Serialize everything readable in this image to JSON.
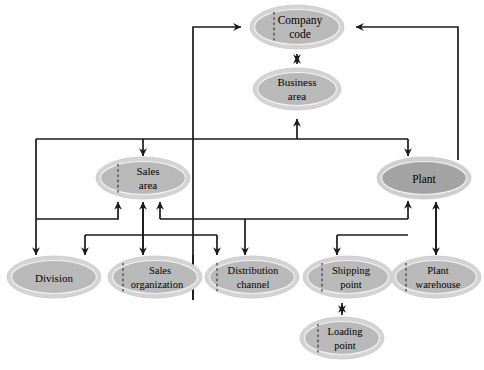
{
  "diagram": {
    "canvas": {
      "width": 484,
      "height": 370,
      "background": "#ffffff"
    },
    "style": {
      "node_fill_light": "#b9b9b9",
      "node_fill_dark": "#a3a3a3",
      "node_ring_fill": "#d4d4d4",
      "node_ring_stroke": "#c9c9c9",
      "edge_color": "#1a1a1a",
      "label_color": "#000000",
      "seam_color": "#2b2b2b"
    },
    "nodes": [
      {
        "id": "company-code",
        "label_line1": "Company",
        "label_line2": "code",
        "cx": 297,
        "cy": 27,
        "rx": 47,
        "ry": 22,
        "fill": "#b9b9b9",
        "seam": true
      },
      {
        "id": "business-area",
        "label_line1": "Business",
        "label_line2": "area",
        "cx": 297,
        "cy": 89,
        "rx": 44,
        "ry": 21,
        "fill": "#b9b9b9",
        "seam": false
      },
      {
        "id": "sales-area",
        "label_line1": "Sales",
        "label_line2": "area",
        "cx": 143,
        "cy": 178,
        "rx": 47,
        "ry": 21,
        "fill": "#b9b9b9",
        "seam": true
      },
      {
        "id": "plant",
        "label_line1": "Plant",
        "label_line2": "",
        "cx": 424,
        "cy": 178,
        "rx": 47,
        "ry": 21,
        "fill": "#a3a3a3",
        "seam": false
      },
      {
        "id": "division",
        "label_line1": "Division",
        "label_line2": "",
        "cx": 54,
        "cy": 277,
        "rx": 47,
        "ry": 21,
        "fill": "#b9b9b9",
        "seam": false
      },
      {
        "id": "sales-organization",
        "label_line1": "Sales",
        "label_line2": "organization",
        "cx": 155,
        "cy": 277,
        "rx": 47,
        "ry": 21,
        "fill": "#b9b9b9",
        "seam": true
      },
      {
        "id": "distribution-channel",
        "label_line1": "Distribution",
        "label_line2": "channel",
        "cx": 252,
        "cy": 277,
        "rx": 47,
        "ry": 21,
        "fill": "#b9b9b9",
        "seam": true
      },
      {
        "id": "shipping-point",
        "label_line1": "Shipping",
        "label_line2": "point",
        "cx": 348,
        "cy": 277,
        "rx": 45,
        "ry": 21,
        "fill": "#b9b9b9",
        "seam": true
      },
      {
        "id": "plant-warehouse",
        "label_line1": "Plant",
        "label_line2": "warehouse",
        "cx": 436,
        "cy": 277,
        "rx": 45,
        "ry": 21,
        "fill": "#b9b9b9",
        "seam": true
      },
      {
        "id": "loading-point",
        "label_line1": "Loading",
        "label_line2": "point",
        "cx": 342,
        "cy": 338,
        "rx": 42,
        "ry": 21,
        "fill": "#b9b9b9",
        "seam": true
      }
    ],
    "edges": [
      {
        "id": "business-area-to-company-code",
        "from": "business-area",
        "to": "company-code",
        "direction": "bidirectional"
      },
      {
        "id": "sales-area-to-company-code",
        "from": "sales-area",
        "to": "company-code",
        "direction": "up"
      },
      {
        "id": "plant-to-company-code",
        "from": "plant",
        "to": "company-code",
        "direction": "up"
      },
      {
        "id": "trunk-to-business-area",
        "from": "trunk",
        "to": "business-area",
        "direction": "up"
      },
      {
        "id": "trunk-to-sales-area",
        "from": "trunk",
        "to": "sales-area",
        "direction": "down"
      },
      {
        "id": "trunk-to-plant",
        "from": "trunk",
        "to": "plant",
        "direction": "down"
      },
      {
        "id": "trunk-to-division",
        "from": "trunk",
        "to": "division",
        "direction": "down"
      },
      {
        "id": "division-to-sales-area",
        "from": "division",
        "to": "sales-area",
        "direction": "up"
      },
      {
        "id": "sales-organization-to-sales-area",
        "from": "sales-organization",
        "to": "sales-area",
        "direction": "bidirectional"
      },
      {
        "id": "distribution-channel-to-sales-area",
        "from": "distribution-channel",
        "to": "sales-area",
        "direction": "up"
      },
      {
        "id": "lowbus-to-sales-organization",
        "from": "bus",
        "to": "sales-organization",
        "direction": "down"
      },
      {
        "id": "lowbus-to-distribution-channel",
        "from": "bus",
        "to": "distribution-channel",
        "direction": "down"
      },
      {
        "id": "lowbus-to-shipping-point",
        "from": "bus",
        "to": "shipping-point",
        "direction": "down"
      },
      {
        "id": "lowbus-to-plant",
        "from": "bus",
        "to": "plant",
        "direction": "up"
      },
      {
        "id": "shipping-point-branch-to-plant",
        "from": "shipping-point-branch",
        "to": "plant",
        "direction": "up"
      },
      {
        "id": "plant-warehouse-to-plant",
        "from": "plant-warehouse",
        "to": "plant",
        "direction": "bidirectional"
      },
      {
        "id": "loading-point-to-shipping-point",
        "from": "loading-point",
        "to": "shipping-point",
        "direction": "bidirectional"
      }
    ]
  }
}
